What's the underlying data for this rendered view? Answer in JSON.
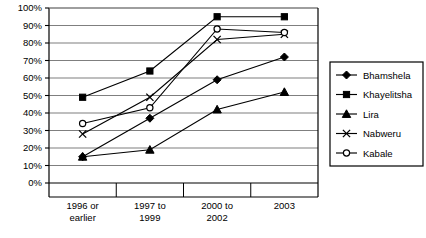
{
  "chart_data": {
    "type": "line",
    "title": "",
    "xlabel": "",
    "ylabel": "",
    "ylim": [
      0,
      100
    ],
    "ytick_labels": [
      "0%",
      "10%",
      "20%",
      "30%",
      "40%",
      "50%",
      "60%",
      "70%",
      "80%",
      "90%",
      "100%"
    ],
    "ytick_values": [
      0,
      10,
      20,
      30,
      40,
      50,
      60,
      70,
      80,
      90,
      100
    ],
    "grid": true,
    "legend_position": "right",
    "categories": [
      "1996 or earlier",
      "1997 to 1999",
      "2000 to 2002",
      "2003"
    ],
    "category_lines": [
      [
        "1996 or",
        "earlier"
      ],
      [
        "1997 to",
        "1999"
      ],
      [
        "2000 to",
        "2002"
      ],
      [
        "2003",
        ""
      ]
    ],
    "series": [
      {
        "name": "Bhamshela",
        "marker": "diamond",
        "values": [
          15,
          37,
          59,
          72
        ]
      },
      {
        "name": "Khayelitsha",
        "marker": "square",
        "values": [
          49,
          64,
          95,
          95
        ]
      },
      {
        "name": "Lira",
        "marker": "triangle",
        "values": [
          15,
          19,
          42,
          52
        ]
      },
      {
        "name": "Nabweru",
        "marker": "x",
        "values": [
          28,
          49,
          82,
          85
        ]
      },
      {
        "name": "Kabale",
        "marker": "circle",
        "values": [
          34,
          43,
          88,
          86
        ]
      }
    ]
  },
  "colors": {
    "line": "#000000",
    "grid": "#7f7f7f",
    "axis": "#000000",
    "background": "#ffffff",
    "legend_border": "#000000"
  }
}
